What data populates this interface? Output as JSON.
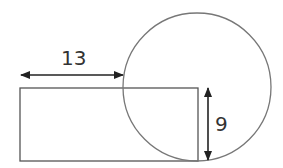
{
  "diagram": {
    "labels": {
      "horizontal_length": "13",
      "vertical_length": "9"
    },
    "shapes": {
      "rectangle": {
        "x": 20,
        "y": 88,
        "width": 178,
        "height": 73
      },
      "circle": {
        "cx": 197,
        "cy": 87,
        "r": 74
      }
    },
    "colors": {
      "stroke": "#555555",
      "arrow": "#222222",
      "text": "#333333"
    }
  }
}
